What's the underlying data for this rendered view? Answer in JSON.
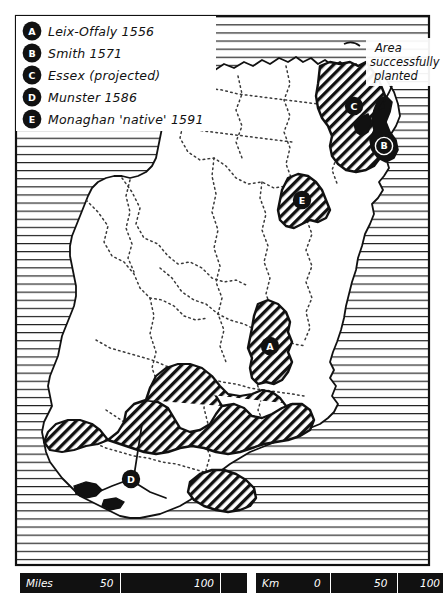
{
  "figure": {
    "frame_color": "#111111",
    "sea_color": "#ffffff",
    "land_color": "#ffffff",
    "plantation_fill": "#111111",
    "background": "#ffffff"
  },
  "legend": {
    "name": "plantation-legend",
    "items": [
      {
        "badge": "A",
        "label": "Leix-Offaly  1556"
      },
      {
        "badge": "B",
        "label": "Smith  1571"
      },
      {
        "badge": "C",
        "label": "Essex (projected)"
      },
      {
        "badge": "D",
        "label": "Munster  1586"
      },
      {
        "badge": "E",
        "label": "Monaghan 'native' 1591"
      }
    ]
  },
  "annotation": {
    "name": "area-successfully-planted",
    "line1": "Area",
    "line2": "successfully",
    "line3": "planted"
  },
  "map_badges": [
    {
      "letter": "A",
      "region": "leix-offaly"
    },
    {
      "letter": "B",
      "region": "smith-ards"
    },
    {
      "letter": "C",
      "region": "essex-antrim"
    },
    {
      "letter": "D",
      "region": "munster"
    },
    {
      "letter": "E",
      "region": "monaghan"
    }
  ],
  "scales": {
    "miles": {
      "unit_label": "Miles",
      "ticks": [
        "50",
        "100"
      ]
    },
    "km": {
      "unit_label": "Km",
      "ticks": [
        "0",
        "50",
        "100"
      ]
    }
  }
}
